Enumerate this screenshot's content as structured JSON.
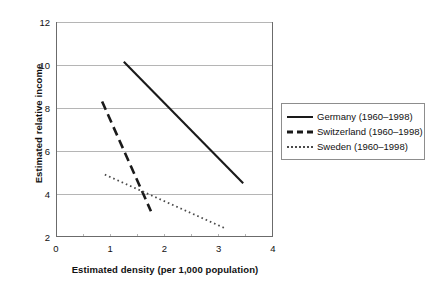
{
  "chart_data": {
    "type": "line",
    "title": "",
    "xlabel": "Estimated density (per 1,000 population)",
    "ylabel": "Estimated relative income",
    "xlim": [
      0,
      4
    ],
    "ylim": [
      2,
      12
    ],
    "xticks": [
      "0",
      "1",
      "2",
      "3",
      "4"
    ],
    "xtick_values": [
      0,
      1,
      2,
      3,
      4
    ],
    "xminor_step": 0.5,
    "yticks": [
      "2",
      "4",
      "6",
      "8",
      "10",
      "12"
    ],
    "ytick_values": [
      2,
      4,
      6,
      8,
      10,
      12
    ],
    "grid": "horizontal",
    "legend_position": "right",
    "series": [
      {
        "name": "Germany (1960–1998)",
        "style": "solid",
        "color": "#1a1a1a",
        "points": [
          [
            1.25,
            10.15
          ],
          [
            3.45,
            4.5
          ]
        ]
      },
      {
        "name": "Switzerland (1960–1998)",
        "style": "dashed",
        "color": "#1a1a1a",
        "points": [
          [
            0.85,
            8.3
          ],
          [
            1.75,
            3.2
          ]
        ]
      },
      {
        "name": "Sweden (1960–1998)",
        "style": "dotted",
        "color": "#4a4a4a",
        "points": [
          [
            0.9,
            4.9
          ],
          [
            3.12,
            2.4
          ]
        ]
      }
    ]
  },
  "legend": {
    "items": [
      {
        "label": "Germany (1960–1998)",
        "style": "solid"
      },
      {
        "label": "Switzerland (1960–1998)",
        "style": "dashed"
      },
      {
        "label": "Sweden (1960–1998)",
        "style": "dotted"
      }
    ]
  },
  "colors": {
    "axis": "#6b6b6b",
    "grid": "#b5b5b5",
    "text": "#111111",
    "legend_border": "#8d8d8d"
  }
}
